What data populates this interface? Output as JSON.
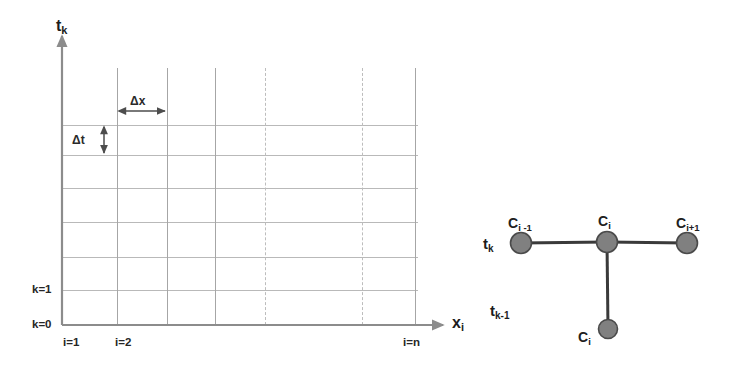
{
  "figure": {
    "width": 748,
    "height": 371,
    "background": "#ffffff",
    "grid_color": "#b9b9b9",
    "axis_color": "#8c8c8c",
    "node_fill": "#808080",
    "node_stroke": "#4a4a4a",
    "bond_color": "#3a3a3a",
    "text_color": "#1c1c1c"
  },
  "grid_panel": {
    "name": "computational-grid",
    "vertical_axis": {
      "label_main": "t",
      "label_sub": "k",
      "full_label": "t_k"
    },
    "horizontal_axis": {
      "label_main": "x",
      "label_sub": "i",
      "full_label": "x_i"
    },
    "spacing_annotations": [
      {
        "id": "dx",
        "label": "Δx",
        "orientation": "horizontal"
      },
      {
        "id": "dt",
        "label": "Δt",
        "orientation": "vertical"
      }
    ],
    "y_tick_labels": [
      "k=1",
      "k=0"
    ],
    "x_tick_labels": [
      "i=1",
      "i=2",
      "i=n"
    ],
    "vertical_lines": [
      {
        "x": 117,
        "style": "solid"
      },
      {
        "x": 167,
        "style": "solid"
      },
      {
        "x": 215,
        "style": "solid"
      },
      {
        "x": 265,
        "style": "dashed"
      },
      {
        "x": 362,
        "style": "dashed"
      },
      {
        "x": 415,
        "style": "solid"
      }
    ],
    "horizontal_lines": [
      125,
      155,
      188,
      222,
      257,
      290,
      325
    ]
  },
  "stencil_panel": {
    "name": "three-point-stencil",
    "time_levels": [
      {
        "label_main": "t",
        "label_sub": "k",
        "full_label": "t_k"
      },
      {
        "label_main": "t",
        "label_sub": "k-1",
        "full_label": "t_k-1"
      }
    ],
    "nodes": [
      {
        "id": "c-left",
        "label_main": "C",
        "label_sub": "i -1",
        "full_label": "C_i-1",
        "cx": 521,
        "cy": 243
      },
      {
        "id": "c-center",
        "label_main": "C",
        "label_sub": "i",
        "full_label": "C_i",
        "cx": 607,
        "cy": 242
      },
      {
        "id": "c-right",
        "label_main": "C",
        "label_sub": "i+1",
        "full_label": "C_i+1",
        "cx": 687,
        "cy": 243
      },
      {
        "id": "c-below",
        "label_main": "C",
        "label_sub": "i",
        "full_label": "C_i",
        "cx": 608,
        "cy": 329
      }
    ],
    "bonds": [
      {
        "from": "c-left",
        "to": "c-center"
      },
      {
        "from": "c-center",
        "to": "c-right"
      },
      {
        "from": "c-center",
        "to": "c-below"
      }
    ]
  }
}
